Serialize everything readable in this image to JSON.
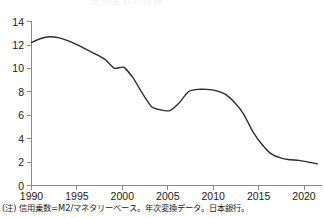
{
  "figure": {
    "title_fragment": "信用乗数の推移",
    "note": "(注) 信用乗数=M2/マネタリーベース。年次変換データ。日本銀行。"
  },
  "chart_data": {
    "type": "line",
    "title": "信用乗数の推移",
    "xlabel": "",
    "ylabel": "",
    "xlim": [
      1990,
      2021.5
    ],
    "ylim": [
      0,
      14
    ],
    "grid": false,
    "legend": null,
    "x_ticks": [
      1990,
      1995,
      2000,
      2005,
      2010,
      2015,
      2020
    ],
    "x_tick_labels": [
      "1990",
      "1995",
      "2000",
      "2005",
      "2010",
      "2015",
      "2020"
    ],
    "y_ticks": [
      0,
      2,
      4,
      6,
      8,
      10,
      12,
      14
    ],
    "y_tick_labels": [
      "0",
      "2",
      "4",
      "6",
      "8",
      "10",
      "12",
      "14"
    ],
    "series": [
      {
        "name": "信用乗数 (M2/マネタリーベース)",
        "color": "#2b2b2b",
        "x": [
          1990,
          1991,
          1992,
          1993,
          1994,
          1995,
          1996,
          1997,
          1998,
          1999,
          2000,
          2001,
          2002,
          2003,
          2004,
          2005,
          2006,
          2007,
          2008,
          2009,
          2010,
          2011,
          2012,
          2013,
          2014,
          2015,
          2016,
          2017,
          2018,
          2019,
          2020,
          2021
        ],
        "values": [
          12.2,
          12.55,
          12.7,
          12.6,
          12.35,
          12.0,
          11.6,
          11.2,
          10.75,
          10.0,
          10.1,
          9.2,
          7.9,
          6.75,
          6.45,
          6.4,
          7.05,
          8.0,
          8.2,
          8.2,
          8.1,
          7.8,
          7.1,
          6.1,
          4.6,
          3.5,
          2.7,
          2.35,
          2.2,
          2.15,
          2.0,
          1.85
        ]
      }
    ]
  }
}
